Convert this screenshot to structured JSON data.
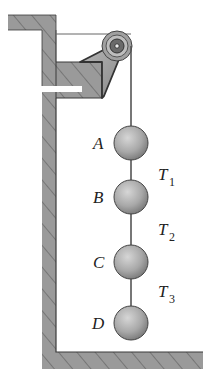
{
  "diagram": {
    "type": "pulley-hanging-masses",
    "colors": {
      "wall_fill": "#9a9a9a",
      "hatch": "#5a5a5a",
      "outline": "#3a3a3a",
      "ball_light": "#c8c8c8",
      "ball_dark": "#7a7a7a",
      "rope": "#555555",
      "background": "#ffffff"
    },
    "masses": [
      {
        "label": "A",
        "cx": 131,
        "cy": 143
      },
      {
        "label": "B",
        "cx": 131,
        "cy": 197
      },
      {
        "label": "C",
        "cx": 131,
        "cy": 262
      },
      {
        "label": "D",
        "cx": 131,
        "cy": 323
      }
    ],
    "tensions": [
      {
        "symbol": "T",
        "sub": "1"
      },
      {
        "symbol": "T",
        "sub": "2"
      },
      {
        "symbol": "T",
        "sub": "3"
      }
    ],
    "pulley": {
      "cx": 117,
      "cy": 46,
      "r": 15
    }
  }
}
